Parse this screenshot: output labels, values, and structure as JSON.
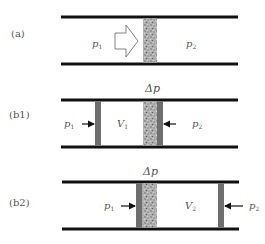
{
  "panels": [
    {
      "id": "a",
      "label": "(a)",
      "left_pressure": "p",
      "left_pressure_sub": "1",
      "right_pressure": "p",
      "right_pressure_sub": "2"
    },
    {
      "id": "b1",
      "label": "(b1)",
      "top_label": "Δp",
      "left_pressure": "p",
      "left_pressure_sub": "1",
      "volume": "V",
      "volume_sub": "1",
      "right_pressure": "p",
      "right_pressure_sub": "2"
    },
    {
      "id": "b2",
      "label": "(b2)",
      "top_label": "Δp",
      "left_pressure": "p",
      "left_pressure_sub": "1",
      "volume": "V",
      "volume_sub": "2",
      "right_pressure": "p",
      "right_pressure_sub": "2"
    }
  ],
  "colors": {
    "wall": "#111111",
    "piston": "#6e6e6e",
    "plug": "#a8a8a8",
    "text": "#555555"
  }
}
